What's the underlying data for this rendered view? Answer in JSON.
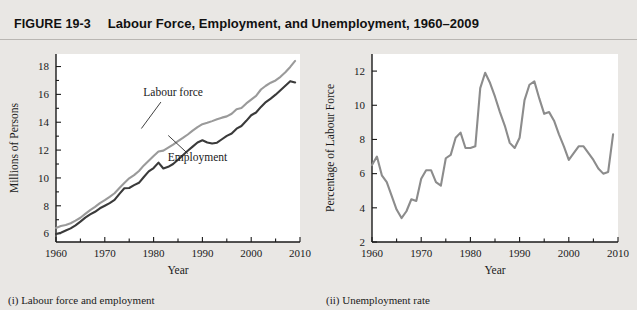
{
  "header": {
    "figure_number": "FIGURE 19-3",
    "title": "Labour Force, Employment, and Unemployment, 1960–2009"
  },
  "panels": {
    "left": {
      "caption": "(i) Labour force and employment",
      "xlabel": "Year",
      "ylabel": "Millions of Persons"
    },
    "right": {
      "caption": "(ii) Unemployment rate",
      "xlabel": "Year",
      "ylabel": "Percentage of Labour Force"
    }
  },
  "colors": {
    "page_background": "#e9e7e4",
    "plot_background": "#ffffff",
    "axis": "#1a1a1a",
    "labour_force_line": "#9a9a9a",
    "employment_line": "#3a3a3a",
    "unemployment_line": "#8c8c8c",
    "rule": "#b9b6b2"
  },
  "chart_data": [
    {
      "type": "line",
      "title": "(i) Labour force and employment",
      "xlabel": "Year",
      "ylabel": "Millions of Persons",
      "xlim": [
        1960,
        2010
      ],
      "ylim": [
        5.4,
        18.9
      ],
      "xticks": [
        1960,
        1970,
        1980,
        1990,
        2000,
        2010
      ],
      "xtick_labels": [
        "1960",
        "1970",
        "1980",
        "1990",
        "2000",
        "2010"
      ],
      "xminorticks": [
        1965,
        1975,
        1985,
        1995,
        2005
      ],
      "yticks": [
        6,
        8,
        10,
        12,
        14,
        16,
        18
      ],
      "ytick_labels": [
        "6",
        "8",
        "10",
        "12",
        "14",
        "16",
        "18"
      ],
      "yminorticks": [
        7,
        9,
        11,
        13,
        15,
        17
      ],
      "grid": false,
      "legend": "inline-annotations",
      "annotations": [
        {
          "text": "Labour force",
          "x": 1984,
          "y": 15.9
        },
        {
          "text": "Employment",
          "x": 1989,
          "y": 11.2
        }
      ],
      "x": [
        1960,
        1961,
        1962,
        1963,
        1964,
        1965,
        1966,
        1967,
        1968,
        1969,
        1970,
        1971,
        1972,
        1973,
        1974,
        1975,
        1976,
        1977,
        1978,
        1979,
        1980,
        1981,
        1982,
        1983,
        1984,
        1985,
        1986,
        1987,
        1988,
        1989,
        1990,
        1991,
        1992,
        1993,
        1994,
        1995,
        1996,
        1997,
        1998,
        1999,
        2000,
        2001,
        2002,
        2003,
        2004,
        2005,
        2006,
        2007,
        2008,
        2009
      ],
      "series": [
        {
          "name": "Labour force",
          "color": "#9a9a9a",
          "values": [
            6.41,
            6.55,
            6.62,
            6.75,
            6.93,
            7.14,
            7.42,
            7.69,
            7.92,
            8.19,
            8.4,
            8.64,
            8.9,
            9.28,
            9.64,
            9.97,
            10.2,
            10.5,
            10.9,
            11.23,
            11.57,
            11.9,
            11.96,
            12.18,
            12.4,
            12.64,
            12.87,
            13.12,
            13.4,
            13.65,
            13.86,
            13.96,
            14.08,
            14.21,
            14.33,
            14.42,
            14.61,
            14.94,
            15.02,
            15.35,
            15.62,
            15.89,
            16.35,
            16.62,
            16.84,
            17.0,
            17.26,
            17.59,
            17.97,
            18.4
          ]
        },
        {
          "name": "Employment",
          "color": "#3a3a3a",
          "values": [
            5.97,
            6.06,
            6.22,
            6.38,
            6.6,
            6.86,
            7.15,
            7.38,
            7.57,
            7.82,
            8.0,
            8.19,
            8.42,
            8.86,
            9.26,
            9.28,
            9.48,
            9.65,
            10.07,
            10.47,
            10.71,
            11.1,
            10.68,
            10.8,
            11.0,
            11.31,
            11.63,
            11.95,
            12.25,
            12.55,
            12.7,
            12.55,
            12.47,
            12.53,
            12.78,
            13.02,
            13.19,
            13.54,
            13.73,
            14.1,
            14.5,
            14.7,
            15.1,
            15.45,
            15.7,
            15.98,
            16.3,
            16.62,
            16.95,
            16.85
          ]
        }
      ]
    },
    {
      "type": "line",
      "title": "(ii) Unemployment rate",
      "xlabel": "Year",
      "ylabel": "Percentage of Labour Force",
      "xlim": [
        1960,
        2010
      ],
      "ylim": [
        2,
        13
      ],
      "xticks": [
        1960,
        1970,
        1980,
        1990,
        2000,
        2010
      ],
      "xtick_labels": [
        "1960",
        "1970",
        "1980",
        "1990",
        "2000",
        "2010"
      ],
      "xminorticks": [
        1965,
        1975,
        1985,
        1995,
        2005
      ],
      "yticks": [
        2,
        4,
        6,
        8,
        10,
        12
      ],
      "ytick_labels": [
        "2",
        "4",
        "6",
        "8",
        "10",
        "12"
      ],
      "grid": false,
      "x": [
        1960,
        1961,
        1962,
        1963,
        1964,
        1965,
        1966,
        1967,
        1968,
        1969,
        1970,
        1971,
        1972,
        1973,
        1974,
        1975,
        1976,
        1977,
        1978,
        1979,
        1980,
        1981,
        1982,
        1983,
        1984,
        1985,
        1986,
        1987,
        1988,
        1989,
        1990,
        1991,
        1992,
        1993,
        1994,
        1995,
        1996,
        1997,
        1998,
        1999,
        2000,
        2001,
        2002,
        2003,
        2004,
        2005,
        2006,
        2007,
        2008,
        2009
      ],
      "series": [
        {
          "name": "Unemployment rate",
          "color": "#8c8c8c",
          "values": [
            6.5,
            7.0,
            5.9,
            5.5,
            4.7,
            3.9,
            3.4,
            3.8,
            4.5,
            4.4,
            5.7,
            6.2,
            6.2,
            5.5,
            5.3,
            6.9,
            7.1,
            8.1,
            8.4,
            7.5,
            7.5,
            7.6,
            11.0,
            11.9,
            11.3,
            10.5,
            9.6,
            8.8,
            7.8,
            7.5,
            8.1,
            10.3,
            11.2,
            11.4,
            10.4,
            9.5,
            9.6,
            9.1,
            8.3,
            7.6,
            6.8,
            7.2,
            7.6,
            7.6,
            7.2,
            6.8,
            6.3,
            6.0,
            6.1,
            8.3
          ]
        }
      ]
    }
  ]
}
